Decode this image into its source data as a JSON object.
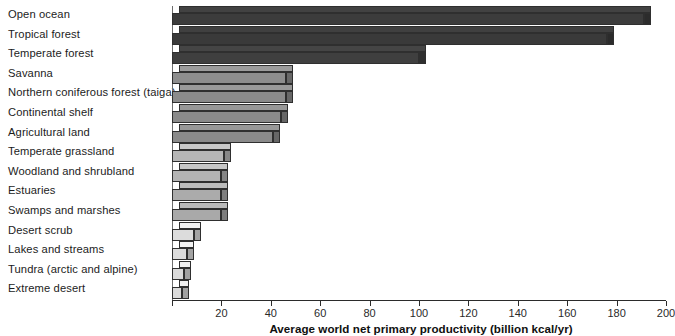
{
  "chart_data": {
    "type": "bar",
    "orientation": "horizontal",
    "title": "",
    "xlabel": "Average world net primary productivity (billion kcal/yr)",
    "ylabel": "",
    "xlim": [
      0,
      200
    ],
    "xticks": [
      0,
      20,
      40,
      60,
      80,
      100,
      120,
      140,
      160,
      180,
      200
    ],
    "xtick_labels": [
      "",
      "20",
      "40",
      "60",
      "80",
      "100",
      "120",
      "140",
      "160",
      "180",
      "200"
    ],
    "grid": false,
    "legend": "none",
    "units": "billion kcal/yr",
    "categories": [
      "Open ocean",
      "Tropical forest",
      "Temperate forest",
      "Savanna",
      "Northern coniferous forest (taiga)",
      "Continental shelf",
      "Agricultural land",
      "Temperate grassland",
      "Woodland and shrubland",
      "Estuaries",
      "Swamps and marshes",
      "Desert scrub",
      "Lakes and streams",
      "Tundra (arctic and alpine)",
      "Extreme desert"
    ],
    "values": [
      191,
      176,
      100,
      46,
      46,
      44,
      41,
      21,
      20,
      20,
      20,
      9,
      6,
      5,
      4
    ],
    "bar_colors": [
      "#3c3c3c",
      "#3a3a3a",
      "#3f3f3f",
      "#8d8d8d",
      "#8b8b8b",
      "#8a8a8a",
      "#8a8a8a",
      "#b6b6b6",
      "#b4b4b4",
      "#ababab",
      "#a9a9a9",
      "#dcdcdc",
      "#dcdcdc",
      "#dadada",
      "#dadada"
    ],
    "axis_color": "#2b2b2b",
    "background": "#ffffff"
  },
  "axis": {
    "title": "Average world net primary productivity (billion kcal/yr)"
  }
}
